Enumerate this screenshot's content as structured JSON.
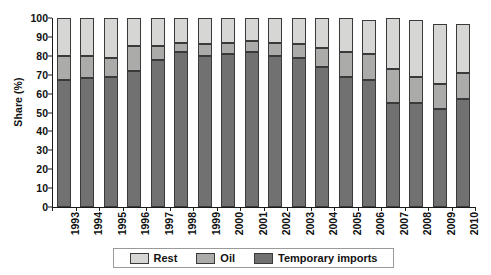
{
  "chart_data": {
    "type": "bar",
    "stacked": true,
    "title": "",
    "xlabel": "",
    "ylabel": "Share (%)",
    "ylim": [
      0,
      100
    ],
    "ytick_step": 10,
    "yticks": [
      0,
      10,
      20,
      30,
      40,
      50,
      60,
      70,
      80,
      90,
      100
    ],
    "grid": false,
    "legend_position": "bottom",
    "legend_entries": [
      "Rest",
      "Oil",
      "Temporary imports"
    ],
    "categories": [
      "1993",
      "1994",
      "1995",
      "1996",
      "1997",
      "1998",
      "1999",
      "2000",
      "2001",
      "2002",
      "2003",
      "2004",
      "2005",
      "2006",
      "2007",
      "2008",
      "2009",
      "2010"
    ],
    "series": [
      {
        "name": "Temporary imports",
        "color": "#717171",
        "values": [
          67,
          68,
          69,
          72,
          78,
          82,
          80,
          81,
          82,
          80,
          79,
          74,
          69,
          67,
          55,
          55,
          52,
          57
        ]
      },
      {
        "name": "Oil",
        "color": "#ababa9",
        "values": [
          13,
          12,
          10,
          13,
          7,
          5,
          6,
          6,
          6,
          7,
          7,
          10,
          13,
          14,
          18,
          14,
          13,
          14
        ]
      },
      {
        "name": "Rest",
        "color": "#d6d6d4",
        "values": [
          20,
          20,
          21,
          15,
          15,
          13,
          14,
          13,
          12,
          13,
          14,
          16,
          18,
          18,
          27,
          30,
          32,
          26
        ]
      }
    ],
    "cumulative_tops": {
      "temporary_imports": [
        67,
        68,
        69,
        72,
        78,
        82,
        80,
        81,
        82,
        80,
        79,
        74,
        69,
        67,
        55,
        55,
        52,
        57
      ],
      "oil": [
        80,
        80,
        79,
        85,
        85,
        87,
        86,
        87,
        88,
        87,
        86,
        84,
        82,
        81,
        73,
        69,
        65,
        71
      ],
      "total": [
        100,
        100,
        100,
        100,
        100,
        100,
        100,
        100,
        100,
        100,
        100,
        100,
        100,
        99,
        100,
        99,
        97,
        97
      ]
    }
  },
  "legend": {
    "items": [
      {
        "label": "Rest",
        "key": "rest"
      },
      {
        "label": "Oil",
        "key": "oil"
      },
      {
        "label": "Temporary imports",
        "key": "temp"
      }
    ]
  }
}
